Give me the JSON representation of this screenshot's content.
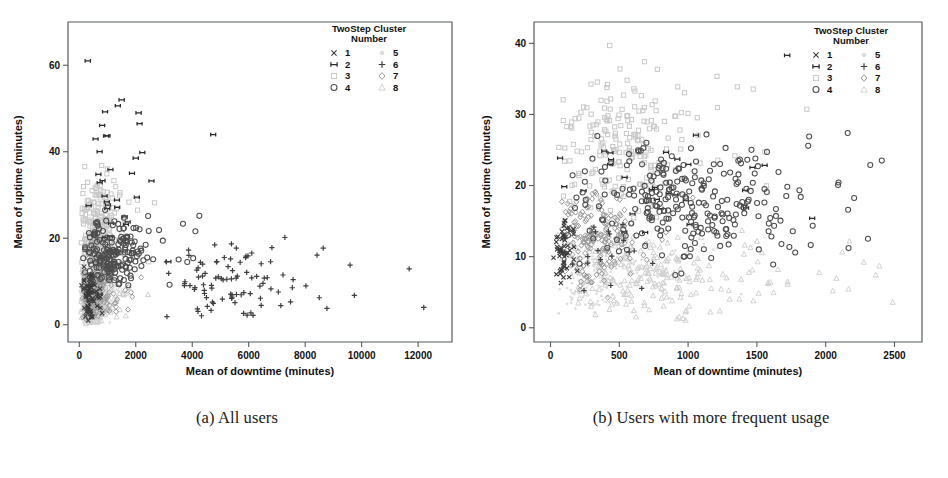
{
  "figure": {
    "panels": [
      {
        "id": "a",
        "caption": "(a) All users",
        "xlabel": "Mean of downtime (minutes)",
        "ylabel": "Mean of uptime (minutes)",
        "xticks": [
          "0",
          "2000",
          "4000",
          "6000",
          "8000",
          "10000",
          "12000"
        ],
        "yticks": [
          "0",
          "20",
          "40",
          "60"
        ],
        "xlim": [
          -400,
          13200
        ],
        "ylim": [
          -4,
          70
        ],
        "legend": {
          "title_line1": "TwoStep Cluster",
          "title_line2": "Number",
          "entries": [
            {
              "label": "1",
              "marker": "x-cross-icon",
              "color": "#3a3a3a"
            },
            {
              "label": "2",
              "marker": "bowtie-icon",
              "color": "#2b2b2b"
            },
            {
              "label": "3",
              "marker": "square-icon",
              "color": "#c8c8c8"
            },
            {
              "label": "4",
              "marker": "circle-icon",
              "color": "#4d4d4d"
            },
            {
              "label": "5",
              "marker": "dot-faint-icon",
              "color": "#dcdcdc"
            },
            {
              "label": "6",
              "marker": "plus-icon",
              "color": "#3f3f3f"
            },
            {
              "label": "7",
              "marker": "diamond-icon",
              "color": "#9a9a9a"
            },
            {
              "label": "8",
              "marker": "triangle-faint-icon",
              "color": "#cfcfcf"
            }
          ]
        }
      },
      {
        "id": "b",
        "caption": "(b) Users with more frequent usage",
        "xlabel": "Mean of downtime (minutes)",
        "ylabel": "Mean of uptime (minutes)",
        "xticks": [
          "0",
          "500",
          "1000",
          "1500",
          "2000",
          "2500"
        ],
        "yticks": [
          "0",
          "10",
          "20",
          "30",
          "40"
        ],
        "xlim": [
          -120,
          2700
        ],
        "ylim": [
          -2,
          43
        ],
        "legend": {
          "title_line1": "TwoStep Cluster",
          "title_line2": "Number",
          "entries": [
            {
              "label": "1",
              "marker": "x-cross-icon",
              "color": "#3a3a3a"
            },
            {
              "label": "2",
              "marker": "bowtie-icon",
              "color": "#2b2b2b"
            },
            {
              "label": "3",
              "marker": "square-icon",
              "color": "#c8c8c8"
            },
            {
              "label": "4",
              "marker": "circle-icon",
              "color": "#4d4d4d"
            },
            {
              "label": "5",
              "marker": "dot-faint-icon",
              "color": "#dcdcdc"
            },
            {
              "label": "6",
              "marker": "plus-icon",
              "color": "#3f3f3f"
            },
            {
              "label": "7",
              "marker": "diamond-icon",
              "color": "#9a9a9a"
            },
            {
              "label": "8",
              "marker": "triangle-faint-icon",
              "color": "#cfcfcf"
            }
          ]
        }
      }
    ]
  },
  "chart_data": [
    {
      "type": "scatter",
      "title": "(a) All users",
      "xlabel": "Mean of downtime (minutes)",
      "ylabel": "Mean of uptime (minutes)",
      "xlim": [
        -400,
        13200
      ],
      "ylim": [
        -4,
        70
      ],
      "xticks": [
        0,
        2000,
        4000,
        6000,
        8000,
        10000,
        12000
      ],
      "yticks": [
        0,
        20,
        40,
        60
      ],
      "grid": false,
      "legend_position": "inside-top-right",
      "legend_title": "TwoStep Cluster Number",
      "series": [
        {
          "name": "1",
          "marker": "x",
          "color": "#3a3a3a",
          "n": 70,
          "x_range": [
            60,
            900
          ],
          "y_range": [
            0.5,
            14
          ],
          "x_center": 330,
          "y_center": 6.5,
          "x_sd": 210,
          "y_sd": 3.6
        },
        {
          "name": "2",
          "marker": "bowtie",
          "color": "#2b2b2b",
          "n": 34,
          "x_range": [
            120,
            8200
          ],
          "y_range": [
            5,
            61
          ],
          "x_center": 900,
          "y_center": 30,
          "x_sd": 1300,
          "y_sd": 13
        },
        {
          "name": "3",
          "marker": "square",
          "color": "#c8c8c8",
          "n": 230,
          "x_range": [
            60,
            3500
          ],
          "y_range": [
            4,
            40
          ],
          "x_center": 620,
          "y_center": 22,
          "x_sd": 430,
          "y_sd": 6.5
        },
        {
          "name": "4",
          "marker": "circle",
          "color": "#4d4d4d",
          "n": 190,
          "x_range": [
            120,
            5200
          ],
          "y_range": [
            6,
            27
          ],
          "x_center": 1250,
          "y_center": 16.5,
          "x_sd": 900,
          "y_sd": 4.2
        },
        {
          "name": "5",
          "marker": "dot",
          "color": "#dcdcdc",
          "n": 300,
          "x_range": [
            40,
            1400
          ],
          "y_range": [
            0.2,
            16
          ],
          "x_center": 380,
          "y_center": 6,
          "x_sd": 280,
          "y_sd": 4
        },
        {
          "name": "6",
          "marker": "plus",
          "color": "#3f3f3f",
          "n": 95,
          "x_range": [
            2600,
            12400
          ],
          "y_range": [
            0.5,
            23
          ],
          "x_center": 5200,
          "y_center": 9,
          "x_sd": 2000,
          "y_sd": 5.5
        },
        {
          "name": "7",
          "marker": "diamond",
          "color": "#9a9a9a",
          "n": 170,
          "x_range": [
            80,
            3000
          ],
          "y_range": [
            1,
            20
          ],
          "x_center": 560,
          "y_center": 9,
          "x_sd": 420,
          "y_sd": 4.5
        },
        {
          "name": "8",
          "marker": "triangle",
          "color": "#cfcfcf",
          "n": 210,
          "x_range": [
            60,
            2600
          ],
          "y_range": [
            0.3,
            14
          ],
          "x_center": 470,
          "y_center": 5,
          "x_sd": 380,
          "y_sd": 3.4
        }
      ],
      "notable_points": [
        {
          "series": "2",
          "x": 300,
          "y": 61
        },
        {
          "series": "2",
          "x": 1500,
          "y": 52
        },
        {
          "series": "2",
          "x": 2100,
          "y": 49
        },
        {
          "series": "2",
          "x": 2000,
          "y": 38.5
        },
        {
          "series": "6",
          "x": 12200,
          "y": 4
        }
      ]
    },
    {
      "type": "scatter",
      "title": "(b) Users with more frequent usage",
      "xlabel": "Mean of downtime (minutes)",
      "ylabel": "Mean of uptime (minutes)",
      "xlim": [
        -120,
        2700
      ],
      "ylim": [
        -2,
        43
      ],
      "xticks": [
        0,
        500,
        1000,
        1500,
        2000,
        2500
      ],
      "yticks": [
        0,
        10,
        20,
        30,
        40
      ],
      "grid": false,
      "legend_position": "inside-top-right",
      "legend_title": "TwoStep Cluster Number",
      "series": [
        {
          "name": "1",
          "marker": "x",
          "color": "#3a3a3a",
          "n": 55,
          "x_range": [
            20,
            260
          ],
          "y_range": [
            5,
            17
          ],
          "x_center": 95,
          "y_center": 10.5,
          "x_sd": 55,
          "y_sd": 2.6
        },
        {
          "name": "2",
          "marker": "bowtie",
          "color": "#2b2b2b",
          "n": 30,
          "x_range": [
            60,
            2000
          ],
          "y_range": [
            8,
            38
          ],
          "x_center": 640,
          "y_center": 19,
          "x_sd": 520,
          "y_sd": 7
        },
        {
          "name": "3",
          "marker": "square",
          "color": "#c8c8c8",
          "n": 200,
          "x_range": [
            60,
            2400
          ],
          "y_range": [
            14,
            40
          ],
          "x_center": 500,
          "y_center": 26,
          "x_sd": 380,
          "y_sd": 5
        },
        {
          "name": "4",
          "marker": "circle",
          "color": "#4d4d4d",
          "n": 260,
          "x_range": [
            120,
            2550
          ],
          "y_range": [
            7,
            28
          ],
          "x_center": 950,
          "y_center": 18,
          "x_sd": 620,
          "y_sd": 4.6
        },
        {
          "name": "5",
          "marker": "dot",
          "color": "#dcdcdc",
          "n": 180,
          "x_range": [
            40,
            1400
          ],
          "y_range": [
            2,
            14
          ],
          "x_center": 330,
          "y_center": 7.5,
          "x_sd": 260,
          "y_sd": 3
        },
        {
          "name": "6",
          "marker": "plus",
          "color": "#3f3f3f",
          "n": 18,
          "x_range": [
            120,
            900
          ],
          "y_range": [
            4,
            17
          ],
          "x_center": 350,
          "y_center": 10,
          "x_sd": 200,
          "y_sd": 3.5
        },
        {
          "name": "7",
          "marker": "diamond",
          "color": "#9a9a9a",
          "n": 190,
          "x_range": [
            80,
            1100
          ],
          "y_range": [
            4,
            22
          ],
          "x_center": 330,
          "y_center": 12.5,
          "x_sd": 200,
          "y_sd": 3.8
        },
        {
          "name": "8",
          "marker": "triangle",
          "color": "#cfcfcf",
          "n": 220,
          "x_range": [
            60,
            2500
          ],
          "y_range": [
            1,
            14
          ],
          "x_center": 700,
          "y_center": 7,
          "x_sd": 500,
          "y_sd": 3.2
        }
      ],
      "notable_points": [
        {
          "series": "3",
          "x": 430,
          "y": 39.7
        },
        {
          "series": "2",
          "x": 1720,
          "y": 38.3
        },
        {
          "series": "4",
          "x": 2160,
          "y": 27.4
        },
        {
          "series": "4",
          "x": 1880,
          "y": 26.9
        }
      ]
    }
  ]
}
